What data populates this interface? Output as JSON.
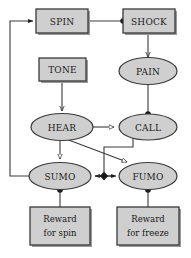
{
  "diagram": {
    "type": "node-link-diagram",
    "background_color": "#ffffff",
    "palette": {
      "node_fill": "#cfcfcf",
      "node_stroke": "#3a3a3a",
      "edge_stroke": "#3a3a3a",
      "shadow": "#9a9a9a",
      "text": "#1a1a1a"
    },
    "nodes": [
      {
        "id": "spin",
        "label": "SPIN",
        "shape": "rect",
        "cx": 62,
        "cy": 21,
        "w": 52,
        "h": 24
      },
      {
        "id": "shock",
        "label": "SHOCK",
        "shape": "rect",
        "cx": 148,
        "cy": 21,
        "w": 52,
        "h": 24
      },
      {
        "id": "tone",
        "label": "TONE",
        "shape": "rect",
        "cx": 62,
        "cy": 69,
        "w": 47,
        "h": 23
      },
      {
        "id": "pain",
        "label": "PAIN",
        "shape": "ellipse",
        "cx": 148,
        "cy": 72,
        "w": 58,
        "h": 26
      },
      {
        "id": "hear",
        "label": "HEAR",
        "shape": "ellipse",
        "cx": 62,
        "cy": 127,
        "w": 62,
        "h": 26
      },
      {
        "id": "call",
        "label": "CALL",
        "shape": "ellipse",
        "cx": 148,
        "cy": 127,
        "w": 58,
        "h": 26
      },
      {
        "id": "sumo",
        "label": "SUMO",
        "shape": "ellipse",
        "cx": 60,
        "cy": 176,
        "w": 62,
        "h": 26
      },
      {
        "id": "fumo",
        "label": "FUMO",
        "shape": "ellipse",
        "cx": 148,
        "cy": 176,
        "w": 58,
        "h": 26
      },
      {
        "id": "reward-spin",
        "label": "Reward\nfor spin",
        "line1": "Reward",
        "line2": "for spin",
        "shape": "rect",
        "cx": 60,
        "cy": 226,
        "w": 60,
        "h": 38
      },
      {
        "id": "reward-freeze",
        "label": "Reward\nfor freeze",
        "line1": "Reward",
        "line2": "for freeze",
        "shape": "rect",
        "cx": 148,
        "cy": 226,
        "w": 62,
        "h": 38
      }
    ],
    "edges": [
      {
        "id": "spin-to-shock",
        "from": "spin",
        "to": "shock",
        "head": "filled-dot"
      },
      {
        "id": "shock-to-pain",
        "from": "shock",
        "to": "pain",
        "head": "line-arrow"
      },
      {
        "id": "tone-to-hear",
        "from": "tone",
        "to": "hear",
        "head": "line-arrow"
      },
      {
        "id": "pain-to-call",
        "from": "pain",
        "to": "call",
        "head": "filled-dot"
      },
      {
        "id": "hear-to-call",
        "from": "hear",
        "to": "call",
        "head": "open-triangle"
      },
      {
        "id": "hear-to-sumo",
        "from": "hear",
        "to": "sumo",
        "head": "open-triangle"
      },
      {
        "id": "hear-to-fumo",
        "from": "hear",
        "to": "fumo",
        "head": "open-triangle"
      },
      {
        "id": "call-to-sumo-fumo-link",
        "from": "call",
        "to": "sumo-fumo-hub",
        "head": "filled-diamond"
      },
      {
        "id": "hub-to-sumo",
        "from": "sumo-fumo-hub",
        "to": "sumo",
        "head": "filled-arrow"
      },
      {
        "id": "hub-to-fumo",
        "from": "sumo-fumo-hub",
        "to": "fumo",
        "head": "filled-arrow"
      },
      {
        "id": "reward-spin-to-sumo",
        "from": "reward-spin",
        "to": "sumo",
        "head": "filled-dot"
      },
      {
        "id": "reward-freeze-to-fumo",
        "from": "reward-freeze",
        "to": "fumo",
        "head": "filled-dot"
      },
      {
        "id": "sumo-to-spin-feedback",
        "from": "sumo",
        "to": "spin",
        "head": "filled-arrow"
      }
    ]
  }
}
